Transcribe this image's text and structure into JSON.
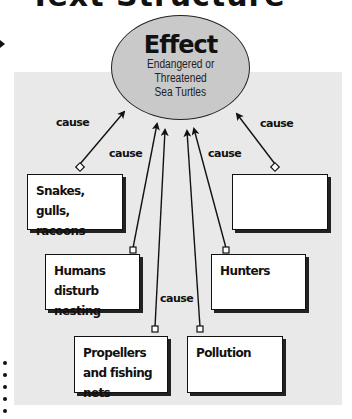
{
  "heading": {
    "text": "Text Structure"
  },
  "effect": {
    "title": "Effect",
    "lines": [
      "Endangered or",
      "Threatened",
      "Sea Turtles"
    ]
  },
  "connector_label": "cause",
  "causes": [
    {
      "label": "Snakes, gulls, racoons"
    },
    {
      "label": ""
    },
    {
      "label": "Humans disturb nesting"
    },
    {
      "label": "Hunters"
    },
    {
      "label": "Propellers and fishing nets"
    },
    {
      "label": "Pollution"
    }
  ],
  "colors": {
    "panel": "#e9e9e9",
    "ellipse_fill": "#c9c9c9",
    "stroke": "#111111",
    "box_fill": "#ffffff"
  }
}
